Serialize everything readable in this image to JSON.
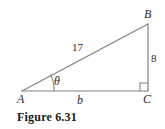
{
  "figure": {
    "caption": "Figure 6.31",
    "stroke_color": "#808080",
    "label_color": "#2b2b2b",
    "caption_color": "#1a1a1a",
    "background_color": "#ffffff"
  },
  "diagram": {
    "type": "right-triangle",
    "vertices": [
      {
        "name": "A",
        "label": "A",
        "x": 22,
        "y": 91,
        "position": "bottom-left"
      },
      {
        "name": "B",
        "label": "B",
        "x": 148,
        "y": 24,
        "position": "top-right"
      },
      {
        "name": "C",
        "label": "C",
        "x": 148,
        "y": 91,
        "position": "bottom-right"
      }
    ],
    "sides": [
      {
        "name": "hypotenuse",
        "from": "A",
        "to": "B",
        "label": "17"
      },
      {
        "name": "opposite",
        "from": "B",
        "to": "C",
        "label": "8"
      },
      {
        "name": "adjacent",
        "from": "A",
        "to": "C",
        "label": "b"
      }
    ],
    "angles": [
      {
        "at": "A",
        "label": "θ",
        "marker": "arc"
      },
      {
        "at": "C",
        "label": "",
        "marker": "right-angle-square"
      }
    ]
  }
}
